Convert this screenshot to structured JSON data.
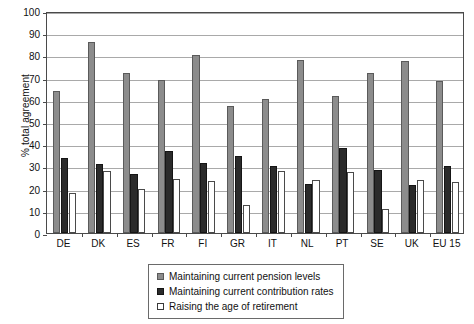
{
  "chart_data": {
    "type": "bar",
    "title": "",
    "subtitle": "",
    "xlabel": "",
    "ylabel": "% total agreement",
    "ylim": [
      0,
      100
    ],
    "ytick_step": 10,
    "yticks": [
      0,
      10,
      20,
      30,
      40,
      50,
      60,
      70,
      80,
      90,
      100
    ],
    "grid": "horizontal",
    "legend_position": "bottom-center",
    "categories": [
      "DE",
      "DK",
      "ES",
      "FR",
      "FI",
      "GR",
      "IT",
      "NL",
      "PT",
      "SE",
      "UK",
      "EU 15"
    ],
    "series": [
      {
        "name": "Maintaining current pension levels",
        "color": "#8c8c8c",
        "values": [
          64,
          86,
          72,
          69,
          80,
          57,
          60.5,
          78,
          61.5,
          72,
          77.5,
          68.5
        ]
      },
      {
        "name": "Maintaining current contribution rates",
        "color": "#2b2b2b",
        "values": [
          34,
          31,
          26.5,
          37,
          31.5,
          34.5,
          30,
          22,
          38.5,
          28.5,
          21.5,
          30
        ]
      },
      {
        "name": "Raising the age of retirement",
        "color": "#ffffff",
        "values": [
          18,
          28,
          20,
          24.5,
          23.5,
          12.5,
          28,
          24,
          27.5,
          11,
          24,
          23
        ]
      }
    ]
  },
  "legend": {
    "items": [
      {
        "label": "Maintaining current pension levels",
        "swatch": "grey-swatch"
      },
      {
        "label": "Maintaining current contribution rates",
        "swatch": "black-swatch"
      },
      {
        "label": "Raising the age of retirement",
        "swatch": "white-swatch"
      }
    ]
  },
  "axes": {
    "y_title": "% total agreement"
  }
}
